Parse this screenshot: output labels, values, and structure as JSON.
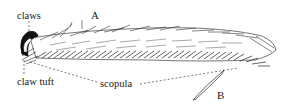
{
  "figure": {
    "labels": {
      "claws": "claws",
      "panel_a": "A",
      "claw_tuft": "claw tuft",
      "scopula": "scopula",
      "panel_b": "B"
    },
    "colors": {
      "ink": "#1a1a1a",
      "background": "#ffffff"
    }
  }
}
